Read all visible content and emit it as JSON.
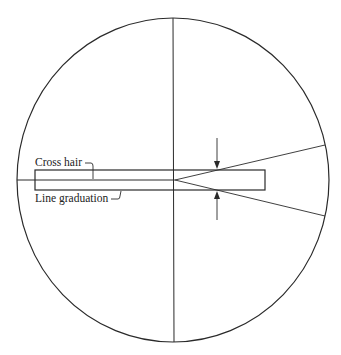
{
  "diagram": {
    "type": "reticle-view",
    "labels": {
      "cross_hair": "Cross hair",
      "line_graduation": "Line graduation"
    },
    "colors": {
      "stroke": "#2a2a2a",
      "background": "#ffffff"
    }
  }
}
